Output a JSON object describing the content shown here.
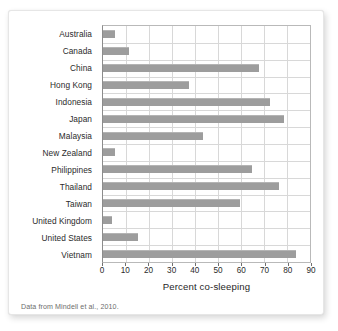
{
  "figure": {
    "source_note": "Data from Mindell et al., 2010.",
    "bar_color": "#9d9d9d",
    "grid_color": "#d8d8d8",
    "axis_color": "#8c8c8c",
    "card_background": "#ffffff"
  },
  "chart_data": {
    "type": "bar",
    "orientation": "horizontal",
    "title": "",
    "xlabel": "Percent co-sleeping",
    "ylabel": "",
    "xlim": [
      0,
      90
    ],
    "xticks": [
      0,
      10,
      20,
      30,
      40,
      50,
      60,
      70,
      80,
      90
    ],
    "xtick_labels": [
      "0",
      "10",
      "20",
      "30",
      "40",
      "50",
      "60",
      "70",
      "80",
      "90"
    ],
    "grid": true,
    "legend": false,
    "categories": [
      "Australia",
      "Canada",
      "China",
      "Hong Kong",
      "Indonesia",
      "Japan",
      "Malaysia",
      "New Zealand",
      "Philippines",
      "Thailand",
      "Taiwan",
      "United Kingdom",
      "United States",
      "Vietnam"
    ],
    "values": [
      5,
      11,
      67,
      37,
      72,
      78,
      43,
      5,
      64,
      76,
      59,
      4,
      15,
      83
    ],
    "annotations": [
      "Data from Mindell et al., 2010."
    ]
  }
}
